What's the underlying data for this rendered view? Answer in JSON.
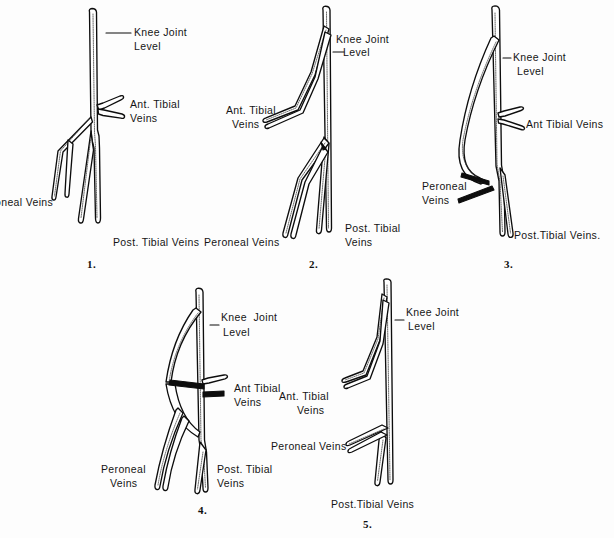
{
  "plate": {
    "title": "Variations in the venous anatomy of the popliteal region",
    "background_color": "#ffffff",
    "ink_color": "#0d0d0d"
  },
  "figures": [
    {
      "number": "1.",
      "labels": {
        "knee_joint": "Knee Joint",
        "knee_level": "Level",
        "ant_tibial": "Ant. Tibial",
        "ant_tibial_2": "Veins",
        "peroneal": "oneal Veins",
        "post_tibial": "Post. Tibial Veins"
      }
    },
    {
      "number": "2.",
      "labels": {
        "knee_joint": "Knee Joint",
        "knee_level": "Level",
        "ant_tibial": "Ant. Tibial",
        "ant_tibial_2": "Veins",
        "peroneal": "Peroneal Veins",
        "post_tibial": "Post. Tibial",
        "post_tibial_2": "Veins"
      }
    },
    {
      "number": "3.",
      "labels": {
        "knee_joint": "Knee Joint",
        "knee_level": "Level",
        "ant_tibial": "Ant Tibial Veins",
        "peroneal": "Peroneal",
        "peroneal_2": "Veins",
        "post_tibial": "Post.Tibial Veins."
      }
    },
    {
      "number": "4.",
      "labels": {
        "knee_joint": "Knee  Joint",
        "knee_level": "Level",
        "ant_tibial": "Ant Tibial",
        "ant_tibial_2": "Veins",
        "peroneal": "Peroneal",
        "peroneal_2": "Veins",
        "post_tibial": "Post. Tibial",
        "post_tibial_2": "Veins"
      }
    },
    {
      "number": "5.",
      "labels": {
        "knee_joint": "Knee Joint",
        "knee_level": "Level",
        "ant_tibial": "Ant. Tibial",
        "ant_tibial_2": "Veins",
        "peroneal": "Peroneal Veins",
        "post_tibial": "Post.Tibial Veins"
      }
    }
  ]
}
